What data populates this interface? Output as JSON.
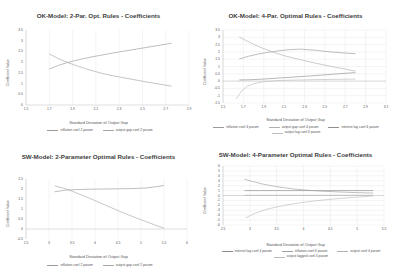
{
  "charts": [
    {
      "id": "ok-2par",
      "title": "OK-Model: 2-Par. Opt. Rules - Coefficients",
      "chart_data": {
        "type": "line",
        "title": "OK-Model: 2-Par. Opt. Rules - Coefficients",
        "xlabel": "Standard Deviation of Output Gap",
        "ylabel": "Coefficient Value",
        "xlim": [
          1.5,
          2.9
        ],
        "ylim": [
          0,
          3.5
        ],
        "xticks": [
          "1.5",
          "1.7",
          "1.9",
          "2.1",
          "2.3",
          "2.5",
          "2.7",
          "2.9"
        ],
        "yticks": [
          "0",
          "0.5",
          "1",
          "1.5",
          "2",
          "2.5",
          "3",
          "3.5"
        ],
        "grid": true,
        "legend_position": "bottom",
        "series": [
          {
            "name": "inflation coef 2 param",
            "color": "#9a9a9a",
            "x": [
              1.7,
              1.78,
              1.86,
              1.95,
              2.05,
              2.15,
              2.25,
              2.35,
              2.45,
              2.55,
              2.65,
              2.75
            ],
            "y": [
              1.68,
              1.85,
              1.99,
              2.11,
              2.23,
              2.33,
              2.43,
              2.52,
              2.61,
              2.7,
              2.79,
              2.88
            ]
          },
          {
            "name": "output gap coef 2 param",
            "color": "#a5a5a5",
            "x": [
              1.7,
              1.78,
              1.86,
              1.95,
              2.05,
              2.15,
              2.25,
              2.35,
              2.45,
              2.55,
              2.65,
              2.75
            ],
            "y": [
              2.38,
              2.16,
              1.98,
              1.8,
              1.63,
              1.48,
              1.36,
              1.26,
              1.16,
              1.06,
              0.97,
              0.88
            ]
          }
        ]
      }
    },
    {
      "id": "ok-4par",
      "title": "OK-Model: 4-Par. Optimal Rules - Coefficients",
      "chart_data": {
        "type": "line",
        "title": "OK-Model: 4-Par. Optimal Rules - Coefficients",
        "xlabel": "Standard Deviation of Output Gap",
        "ylabel": "Coefficient Value",
        "xlim": [
          1.5,
          3.1
        ],
        "ylim": [
          -1.5,
          3.5
        ],
        "xticks": [
          "1.5",
          "1.7",
          "1.9",
          "2.1",
          "2.3",
          "2.5",
          "2.7",
          "2.9",
          "3.1"
        ],
        "yticks": [
          "-1.5",
          "-1",
          "-0.5",
          "0",
          "0.5",
          "1",
          "1.5",
          "2",
          "2.5",
          "3",
          "3.5"
        ],
        "grid": true,
        "legend_position": "bottom",
        "series": [
          {
            "name": "inflation coef 4 param",
            "color": "#9a9a9a",
            "x": [
              1.66,
              1.75,
              1.85,
              1.95,
              2.05,
              2.15,
              2.25,
              2.4,
              2.55,
              2.7,
              2.8
            ],
            "y": [
              1.52,
              1.7,
              1.86,
              1.98,
              2.08,
              2.15,
              2.19,
              2.12,
              2.0,
              1.92,
              1.88
            ]
          },
          {
            "name": "output gap coef 4 param",
            "color": "#b0b0b0",
            "x": [
              1.66,
              1.72,
              1.8,
              1.9,
              2.0,
              2.12,
              2.25,
              2.4,
              2.55,
              2.7,
              2.8
            ],
            "y": [
              3.02,
              2.8,
              2.52,
              2.22,
              1.96,
              1.7,
              1.48,
              1.24,
              1.02,
              0.82,
              0.68
            ]
          },
          {
            "name": "interest lag coef 4 param",
            "color": "#8f8f8f",
            "x": [
              1.66,
              1.75,
              1.85,
              1.95,
              2.05,
              2.2,
              2.35,
              2.5,
              2.65,
              2.8
            ],
            "y": [
              0.08,
              0.09,
              0.12,
              0.16,
              0.21,
              0.28,
              0.35,
              0.43,
              0.51,
              0.58
            ]
          },
          {
            "name": "output lag coef 4 param",
            "color": "#bcbcbc",
            "x": [
              1.63,
              1.68,
              1.74,
              1.82,
              1.92,
              2.05,
              2.2,
              2.4,
              2.6,
              2.8
            ],
            "y": [
              -1.22,
              -0.7,
              -0.35,
              -0.14,
              -0.02,
              0.04,
              0.07,
              0.1,
              0.12,
              0.14
            ]
          }
        ]
      }
    },
    {
      "id": "sw-2par",
      "title": "SW-Model: 2-Parameter Optimal Rules - Coefficients",
      "chart_data": {
        "type": "line",
        "title": "SW-Model: 2-Parameter Optimal Rules - Coefficients",
        "xlabel": "Standard Deviation of Output Gap",
        "ylabel": "Coefficient Value",
        "xlim": [
          2.5,
          6
        ],
        "ylim": [
          -0.5,
          2.5
        ],
        "xticks": [
          "2.5",
          "3",
          "3.5",
          "4",
          "4.5",
          "5",
          "5.5",
          "6"
        ],
        "yticks": [
          "-0.5",
          "0",
          "0.5",
          "1",
          "1.5",
          "2",
          "2.5"
        ],
        "grid": true,
        "legend_position": "bottom",
        "series": [
          {
            "name": "inflation coef 2 param",
            "color": "#9a9a9a",
            "x": [
              3.12,
              3.35,
              3.6,
              3.9,
              4.2,
              4.5,
              4.8,
              5.1,
              5.35,
              5.5
            ],
            "y": [
              1.86,
              1.94,
              1.97,
              1.99,
              2.0,
              2.01,
              2.02,
              2.05,
              2.12,
              2.18
            ]
          },
          {
            "name": "output gap coef 2 param",
            "color": "#a8a8a8",
            "x": [
              3.12,
              3.35,
              3.6,
              3.9,
              4.2,
              4.5,
              4.8,
              5.1,
              5.35,
              5.5
            ],
            "y": [
              2.16,
              2.02,
              1.8,
              1.52,
              1.22,
              0.92,
              0.64,
              0.38,
              0.16,
              0.04
            ]
          }
        ]
      }
    },
    {
      "id": "sw-4par",
      "title": "SW-Model: 4-Parameter Optimal Rules - Coefficients",
      "chart_data": {
        "type": "line",
        "title": "SW-Model: 4-Parameter Optimal Rules - Coefficients",
        "xlabel": "Standard Deviation of Output Gap",
        "ylabel": "Coefficient Value",
        "xlim": [
          2.5,
          5.5
        ],
        "ylim": [
          -6,
          6
        ],
        "xticks": [
          "2.5",
          "3",
          "3.5",
          "4",
          "4.5",
          "5",
          "5.5"
        ],
        "yticks": [
          "-6",
          "-5",
          "-4",
          "-3",
          "-2",
          "-1",
          "0",
          "1",
          "2",
          "3",
          "4",
          "5",
          "6"
        ],
        "grid": true,
        "legend_position": "bottom",
        "series": [
          {
            "name": "interest lag coef 4 param",
            "color": "#8a8a8a",
            "x": [
              2.9,
              3.0,
              3.2,
              3.5,
              3.8,
              4.1,
              4.4,
              4.7,
              5.0,
              5.3
            ],
            "y": [
              1.0,
              1.0,
              1.0,
              1.0,
              1.0,
              1.0,
              1.0,
              1.0,
              1.0,
              1.0
            ]
          },
          {
            "name": "inflation coef 4 param",
            "color": "#9f9f9f",
            "x": [
              2.9,
              3.05,
              3.25,
              3.5,
              3.8,
              4.1,
              4.4,
              4.7,
              5.0,
              5.3
            ],
            "y": [
              3.3,
              2.85,
              2.3,
              1.8,
              1.35,
              1.05,
              0.85,
              0.7,
              0.58,
              0.5
            ]
          },
          {
            "name": "output coef 4 param",
            "color": "#b2b2b2",
            "x": [
              2.9,
              3.2,
              3.6,
              4.0,
              4.4,
              4.8,
              5.1,
              5.3
            ],
            "y": [
              0.05,
              0.05,
              0.05,
              0.05,
              0.05,
              0.05,
              0.05,
              0.05
            ]
          },
          {
            "name": "output lagged coef 4 param",
            "color": "#bcbcbc",
            "x": [
              2.92,
              3.1,
              3.35,
              3.65,
              3.95,
              4.25,
              4.55,
              4.85,
              5.1,
              5.3
            ],
            "y": [
              -4.55,
              -3.6,
              -2.7,
              -2.0,
              -1.45,
              -1.05,
              -0.72,
              -0.45,
              -0.25,
              -0.1
            ]
          }
        ]
      }
    }
  ]
}
